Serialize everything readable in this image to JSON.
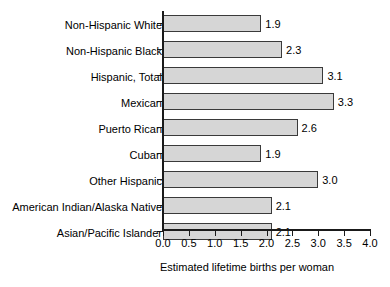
{
  "chart_data": {
    "type": "bar",
    "orientation": "horizontal",
    "title": "",
    "xlabel": "Estimated lifetime births per woman",
    "ylabel": "",
    "categories": [
      "Non-Hispanic White",
      "Non-Hispanic Black",
      "Hispanic, Total",
      "Mexican",
      "Puerto Rican",
      "Cuban",
      "Other Hispanic",
      "American Indian/Alaska Native",
      "Asian/Pacific Islander"
    ],
    "values": [
      1.9,
      2.3,
      3.1,
      3.3,
      2.6,
      1.9,
      3.0,
      2.1,
      2.1
    ],
    "value_labels": [
      "1.9",
      "2.3",
      "3.1",
      "3.3",
      "2.6",
      "1.9",
      "3.0",
      "2.1",
      "2.1"
    ],
    "xlim": [
      0.0,
      4.0
    ],
    "xticks": [
      0.0,
      0.5,
      1.0,
      1.5,
      2.0,
      2.5,
      3.0,
      3.5,
      4.0
    ],
    "xtick_labels": [
      "0.0",
      "0.5",
      "1.0",
      "1.5",
      "2.0",
      "2.5",
      "3.0",
      "3.5",
      "4.0"
    ],
    "grid": false,
    "legend": null,
    "bar_fill_color": "#d6d6d6",
    "bar_border_color": "#3a3a3a",
    "axis_color": "#1a1a1a",
    "background_color": "#ffffff"
  }
}
